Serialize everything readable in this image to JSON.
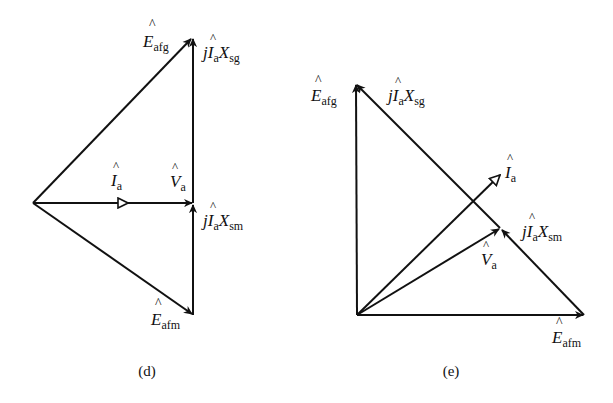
{
  "figure": {
    "background": "#ffffff",
    "stroke_color": "#111111",
    "panels": [
      {
        "id": "d",
        "caption": "(d)",
        "labels": {
          "E_afg": {
            "main": "E",
            "sub": "afg"
          },
          "jIaXsg": {
            "j": "j",
            "main": "I",
            "sub1": "a",
            "x": "X",
            "sub2": "sg"
          },
          "I_a": {
            "main": "I",
            "sub": "a"
          },
          "V_a": {
            "main": "V",
            "sub": "a"
          },
          "jIaXsm": {
            "j": "j",
            "main": "I",
            "sub1": "a",
            "x": "X",
            "sub2": "sm"
          },
          "E_afm": {
            "main": "E",
            "sub": "afm"
          }
        }
      },
      {
        "id": "e",
        "caption": "(e)",
        "labels": {
          "E_afg": {
            "main": "E",
            "sub": "afg"
          },
          "jIaXsg": {
            "j": "j",
            "main": "I",
            "sub1": "a",
            "x": "X",
            "sub2": "sg"
          },
          "I_a": {
            "main": "I",
            "sub": "a"
          },
          "jIaXsm": {
            "j": "j",
            "main": "I",
            "sub1": "a",
            "x": "X",
            "sub2": "sm"
          },
          "V_a": {
            "main": "V",
            "sub": "a"
          },
          "E_afm": {
            "main": "E",
            "sub": "afm"
          }
        }
      }
    ]
  }
}
